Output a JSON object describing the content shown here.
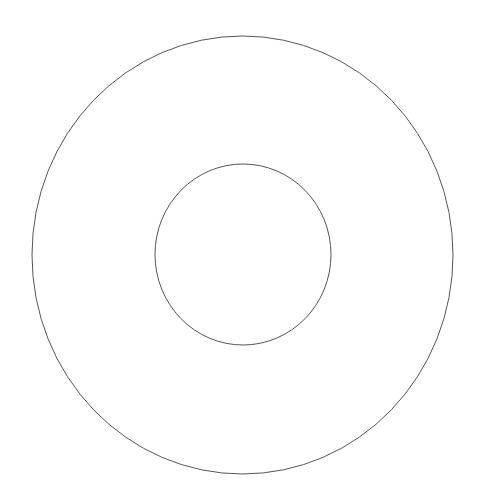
{
  "canvas": {
    "width": 483,
    "height": 495,
    "background": "#ffffff"
  },
  "shapes": {
    "stroke_color": "#555555",
    "stroke_width": 1,
    "outer_circle": {
      "cx": 242.5,
      "cy": 255,
      "rx": 210.5,
      "ry": 219
    },
    "inner_circle": {
      "cx": 243,
      "cy": 254.5,
      "rx": 88,
      "ry": 90.5
    }
  }
}
